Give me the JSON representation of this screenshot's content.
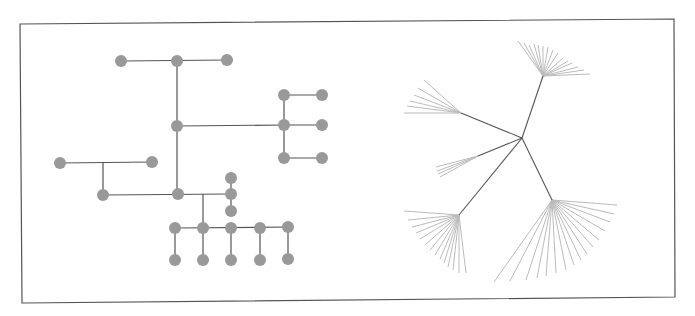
{
  "figure": {
    "width": 695,
    "height": 316,
    "frame": {
      "points": [
        [
          20,
          24
        ],
        [
          674,
          19
        ],
        [
          675,
          297
        ],
        [
          22,
          303
        ]
      ],
      "stroke": "#555555"
    },
    "colors": {
      "node": "#999999",
      "edge_dark": "#555555",
      "edge_light": "#bbbbbb"
    }
  },
  "left_tree": {
    "type": "orthogonal-tree",
    "node_radius": 6,
    "nodes": [
      {
        "id": "n1",
        "x": 121,
        "y": 61
      },
      {
        "id": "n2",
        "x": 177,
        "y": 61
      },
      {
        "id": "n3",
        "x": 227,
        "y": 60
      },
      {
        "id": "n4",
        "x": 177,
        "y": 126
      },
      {
        "id": "n5",
        "x": 284,
        "y": 95
      },
      {
        "id": "n6",
        "x": 322,
        "y": 95
      },
      {
        "id": "n7",
        "x": 284,
        "y": 125
      },
      {
        "id": "n8",
        "x": 322,
        "y": 125
      },
      {
        "id": "n9",
        "x": 284,
        "y": 158
      },
      {
        "id": "n10",
        "x": 322,
        "y": 158
      },
      {
        "id": "n11",
        "x": 60,
        "y": 163
      },
      {
        "id": "n12",
        "x": 152,
        "y": 162
      },
      {
        "id": "n13",
        "x": 103,
        "y": 195
      },
      {
        "id": "n14",
        "x": 178,
        "y": 194
      },
      {
        "id": "n15",
        "x": 231,
        "y": 178
      },
      {
        "id": "n16",
        "x": 231,
        "y": 194
      },
      {
        "id": "n17",
        "x": 231,
        "y": 211
      },
      {
        "id": "n18",
        "x": 175,
        "y": 228
      },
      {
        "id": "n19",
        "x": 203,
        "y": 228
      },
      {
        "id": "n20",
        "x": 231,
        "y": 228
      },
      {
        "id": "n21",
        "x": 260,
        "y": 228
      },
      {
        "id": "n22",
        "x": 288,
        "y": 227
      },
      {
        "id": "n23",
        "x": 175,
        "y": 260
      },
      {
        "id": "n24",
        "x": 203,
        "y": 260
      },
      {
        "id": "n25",
        "x": 231,
        "y": 260
      },
      {
        "id": "n26",
        "x": 260,
        "y": 260
      },
      {
        "id": "n27",
        "x": 288,
        "y": 259
      }
    ],
    "edges": [
      [
        [
          121,
          61
        ],
        [
          227,
          60
        ]
      ],
      [
        [
          177,
          61
        ],
        [
          177,
          194
        ]
      ],
      [
        [
          177,
          126
        ],
        [
          284,
          125
        ]
      ],
      [
        [
          284,
          95
        ],
        [
          284,
          158
        ]
      ],
      [
        [
          284,
          95
        ],
        [
          322,
          95
        ]
      ],
      [
        [
          284,
          125
        ],
        [
          322,
          125
        ]
      ],
      [
        [
          284,
          158
        ],
        [
          322,
          158
        ]
      ],
      [
        [
          60,
          163
        ],
        [
          152,
          162
        ]
      ],
      [
        [
          103,
          163
        ],
        [
          103,
          195
        ]
      ],
      [
        [
          103,
          195
        ],
        [
          231,
          194
        ]
      ],
      [
        [
          231,
          178
        ],
        [
          231,
          211
        ]
      ],
      [
        [
          203,
          194
        ],
        [
          203,
          228
        ]
      ],
      [
        [
          175,
          228
        ],
        [
          288,
          227
        ]
      ],
      [
        [
          175,
          228
        ],
        [
          175,
          260
        ]
      ],
      [
        [
          203,
          228
        ],
        [
          203,
          260
        ]
      ],
      [
        [
          231,
          228
        ],
        [
          231,
          260
        ]
      ],
      [
        [
          260,
          228
        ],
        [
          260,
          260
        ]
      ],
      [
        [
          288,
          227
        ],
        [
          288,
          259
        ]
      ]
    ]
  },
  "right_tree": {
    "type": "radial-tree",
    "root": {
      "x": 522,
      "y": 138
    },
    "branches": [
      {
        "hub": {
          "x": 543,
          "y": 76
        },
        "leaves": [
          [
            518,
            41
          ],
          [
            524,
            43
          ],
          [
            529,
            45
          ],
          [
            534,
            44
          ],
          [
            538,
            45
          ],
          [
            543,
            46
          ],
          [
            548,
            47
          ],
          [
            553,
            50
          ],
          [
            558,
            53
          ],
          [
            563,
            58
          ],
          [
            568,
            61
          ],
          [
            572,
            63
          ],
          [
            578,
            67
          ],
          [
            584,
            70
          ],
          [
            590,
            74
          ]
        ]
      },
      {
        "hub": {
          "x": 461,
          "y": 113
        },
        "leaves": [
          [
            424,
            80
          ],
          [
            418,
            88
          ],
          [
            414,
            95
          ],
          [
            410,
            101
          ],
          [
            407,
            106
          ],
          [
            404,
            113
          ]
        ]
      },
      {
        "hub": {
          "x": 478,
          "y": 156
        },
        "leaves": [
          [
            436,
            167
          ],
          [
            437,
            171
          ],
          [
            438,
            174
          ],
          [
            440,
            177
          ]
        ]
      },
      {
        "hub": {
          "x": 459,
          "y": 215
        },
        "leaves": [
          [
            404,
            211
          ],
          [
            408,
            220
          ],
          [
            412,
            227
          ],
          [
            416,
            233
          ],
          [
            420,
            239
          ],
          [
            425,
            245
          ],
          [
            430,
            250
          ],
          [
            435,
            255
          ],
          [
            440,
            259
          ],
          [
            444,
            263
          ],
          [
            448,
            267
          ],
          [
            453,
            270
          ],
          [
            459,
            273
          ],
          [
            466,
            273
          ]
        ]
      },
      {
        "hub": {
          "x": 552,
          "y": 200
        },
        "leaves": [
          [
            617,
            205
          ],
          [
            614,
            214
          ],
          [
            610,
            222
          ],
          [
            605,
            231
          ],
          [
            599,
            240
          ],
          [
            593,
            247
          ],
          [
            587,
            254
          ],
          [
            581,
            260
          ],
          [
            574,
            265
          ],
          [
            566,
            270
          ],
          [
            556,
            273
          ],
          [
            546,
            276
          ],
          [
            537,
            278
          ],
          [
            526,
            280
          ],
          [
            510,
            281
          ],
          [
            494,
            282
          ]
        ]
      }
    ]
  }
}
